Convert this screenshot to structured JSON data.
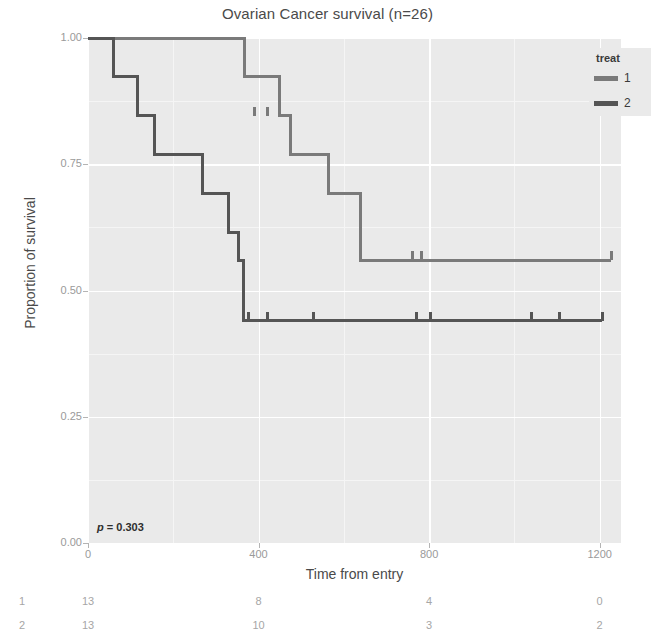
{
  "chart_data": {
    "type": "line",
    "title": "Ovarian Cancer survival (n=26)",
    "xlabel": "Time from entry",
    "ylabel": "Proportion of survival",
    "xlim": [
      0,
      1250
    ],
    "ylim": [
      0,
      1
    ],
    "xticks": [
      0,
      400,
      800,
      1200
    ],
    "xtick_labels": [
      "0",
      "400",
      "800",
      "1200"
    ],
    "yticks": [
      0.0,
      0.25,
      0.5,
      0.75,
      1.0
    ],
    "ytick_labels": [
      "0.00",
      "0.25",
      "0.50",
      "0.75",
      "1.00"
    ],
    "grid": true,
    "legend": {
      "title": "treat",
      "position": "top-right",
      "entries": [
        {
          "label": "1",
          "color": "#7a7a7a"
        },
        {
          "label": "2",
          "color": "#555555"
        }
      ]
    },
    "annotation": {
      "text": "p = 0.303",
      "statistic": "p",
      "value": 0.303
    },
    "series": [
      {
        "name": "1",
        "color": "#7a7a7a",
        "steps": [
          [
            0,
            1.0
          ],
          [
            368,
            1.0
          ],
          [
            368,
            0.923
          ],
          [
            448,
            0.923
          ],
          [
            448,
            0.846
          ],
          [
            475,
            0.846
          ],
          [
            475,
            0.769
          ],
          [
            563,
            0.769
          ],
          [
            563,
            0.692
          ],
          [
            638,
            0.692
          ],
          [
            638,
            0.56
          ],
          [
            1227,
            0.56
          ]
        ],
        "censor_times": [
          390,
          421,
          762,
          781,
          1227
        ],
        "censor_values": [
          0.846,
          0.846,
          0.56,
          0.56,
          0.56
        ]
      },
      {
        "name": "2",
        "color": "#555555",
        "steps": [
          [
            0,
            1.0
          ],
          [
            59,
            1.0
          ],
          [
            59,
            0.923
          ],
          [
            115,
            0.923
          ],
          [
            115,
            0.846
          ],
          [
            156,
            0.846
          ],
          [
            156,
            0.769
          ],
          [
            268,
            0.769
          ],
          [
            268,
            0.692
          ],
          [
            329,
            0.692
          ],
          [
            329,
            0.615
          ],
          [
            353,
            0.615
          ],
          [
            353,
            0.56
          ],
          [
            365,
            0.56
          ],
          [
            365,
            0.44
          ],
          [
            1206,
            0.44
          ]
        ],
        "censor_times": [
          377,
          421,
          529,
          770,
          803,
          1040,
          1106,
          1206
        ],
        "censor_values": [
          0.44,
          0.44,
          0.44,
          0.44,
          0.44,
          0.44,
          0.44,
          0.44
        ]
      }
    ]
  },
  "risk_table": {
    "time_points": [
      0,
      400,
      800,
      1200
    ],
    "rows": [
      {
        "label": "1",
        "counts": [
          "13",
          "8",
          "4",
          "0"
        ]
      },
      {
        "label": "2",
        "counts": [
          "13",
          "10",
          "3",
          "2"
        ]
      }
    ]
  },
  "colors": {
    "panel_background": "#eaeaea",
    "gridline": "#ffffff",
    "text": "#4a4a4a",
    "tick_text": "#9a9a9a",
    "risk_text": "#a6a6a6"
  }
}
